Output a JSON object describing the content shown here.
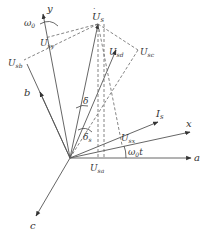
{
  "origin": [
    70,
    158
  ],
  "axes": {
    "a": {
      "label": "a",
      "end": [
        191,
        158
      ]
    },
    "b": {
      "label": "b",
      "end": [
        27,
        64
      ]
    },
    "c": {
      "label": "c",
      "end": [
        36,
        216
      ]
    },
    "x": {
      "label": "x",
      "end": [
        190,
        132
      ]
    },
    "y": {
      "label": "y",
      "end": [
        43,
        14
      ]
    }
  },
  "vectors": {
    "Us": {
      "label": "U̇s",
      "sub": "s",
      "end": [
        98,
        24
      ]
    },
    "Usd": {
      "label": "U̇sd",
      "end": [
        116,
        50
      ]
    },
    "Is": {
      "label": "İs",
      "sub": "s",
      "end": [
        158,
        122
      ]
    }
  },
  "projections": {
    "Usy": {
      "label": "Usy",
      "sub": "sy",
      "pt": [
        45,
        38
      ]
    },
    "Usb": {
      "label": "Usb",
      "sub": "sb",
      "pt": [
        24,
        60
      ]
    },
    "Usc": {
      "label": "Usc",
      "sub": "sc",
      "pt": [
        138,
        50
      ]
    },
    "Usx": {
      "label": "Usx",
      "sub": "sx",
      "pt": [
        122,
        145
      ]
    },
    "Usa": {
      "label": "Usa",
      "sub": "sa",
      "pt": [
        98,
        158
      ]
    }
  },
  "angles": {
    "omega0": {
      "label": "ω",
      "sub": "0"
    },
    "omega0t": {
      "label": "ω",
      "sub": "0",
      "suffix": "t"
    },
    "delta": {
      "label": "δ"
    },
    "delta_s": {
      "label": "δ",
      "sub": "s"
    }
  },
  "colors": {
    "line": "#555555",
    "text": "#333333",
    "background": "#ffffff"
  }
}
